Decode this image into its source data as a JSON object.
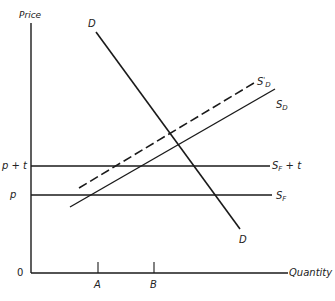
{
  "diagram": {
    "axes": {
      "y_label": "Price",
      "x_label": "Quantity",
      "origin_label": "0"
    },
    "price_levels": [
      {
        "id": "p_plus_t",
        "label": "p + t"
      },
      {
        "id": "p",
        "label": "p"
      }
    ],
    "quantity_ticks": [
      {
        "id": "A",
        "label": "A"
      },
      {
        "id": "B",
        "label": "B"
      }
    ],
    "curves": [
      {
        "id": "demand",
        "label_top": "D",
        "label_bottom": "D",
        "style": "solid"
      },
      {
        "id": "domestic_supply",
        "label": "S",
        "subscript": "D",
        "style": "solid"
      },
      {
        "id": "domestic_supply_shifted",
        "label": "S",
        "prime": "'",
        "subscript": "D",
        "style": "dashed"
      },
      {
        "id": "foreign_supply",
        "label": "S",
        "subscript": "F",
        "style": "solid"
      },
      {
        "id": "foreign_supply_tax",
        "label": "S",
        "subscript": "F",
        "suffix": " + t",
        "style": "solid"
      }
    ],
    "colors": {
      "line": "#1a1a1a",
      "text": "#222222",
      "background": "#ffffff"
    }
  }
}
